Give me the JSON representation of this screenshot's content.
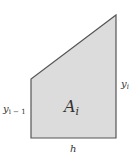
{
  "diagram": {
    "shape": "trapezoid",
    "fill_color": "#dcdcdc",
    "stroke_color": "#555555",
    "vertices": {
      "bottom_left": [
        31,
        138
      ],
      "top_left": [
        31,
        79
      ],
      "top_right": [
        116,
        15
      ],
      "bottom_right": [
        116,
        138
      ]
    },
    "labels": {
      "area": "A",
      "area_sub": "i",
      "left_height": "y",
      "left_height_sub": "i − 1",
      "right_height": "y",
      "right_height_sub": "i",
      "width": "h"
    }
  }
}
